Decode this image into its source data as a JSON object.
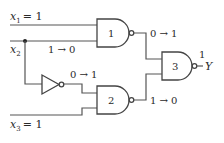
{
  "diagram": {
    "type": "logic-circuit",
    "inputs": [
      {
        "name": "x",
        "sub": "1",
        "value_text": "= 1"
      },
      {
        "name": "x",
        "sub": "2",
        "value_text": ""
      },
      {
        "name": "x",
        "sub": "3",
        "value_text": "= 1"
      }
    ],
    "gates": [
      {
        "id": "1",
        "type": "NAND",
        "label": "1"
      },
      {
        "id": "2",
        "type": "NAND",
        "label": "2"
      },
      {
        "id": "3",
        "type": "NAND",
        "label": "3"
      },
      {
        "id": "inv",
        "type": "NOT",
        "label": ""
      }
    ],
    "transitions": {
      "x2_wire": "1 → 0",
      "inverter_out": "0 → 1",
      "gate1_out": "0 → 1",
      "gate2_out": "1 → 0",
      "gate3_out": "1"
    },
    "output": {
      "name": "Y",
      "dash": "–"
    }
  }
}
